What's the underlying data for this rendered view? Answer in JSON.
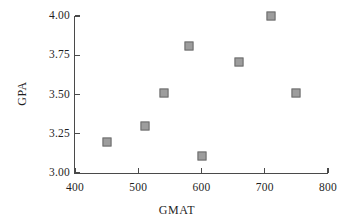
{
  "chart_data": {
    "type": "scatter",
    "title": "",
    "xlabel": "GMAT",
    "ylabel": "GPA",
    "xlim": [
      400,
      800
    ],
    "ylim": [
      3.0,
      4.0
    ],
    "xticks": [
      400,
      500,
      600,
      700,
      800
    ],
    "yticks": [
      3.0,
      3.25,
      3.5,
      3.75,
      4.0
    ],
    "xticklabels": [
      "400",
      "500",
      "600",
      "700",
      "800"
    ],
    "yticklabels": [
      "3.00",
      "3.25",
      "3.50",
      "3.75",
      "4.00"
    ],
    "grid": false,
    "legend": null,
    "marker_style": "square",
    "marker_color": "#9d9d9d",
    "marker_edge_color": "#6d6d6d",
    "axis_color": "#4a4a4a",
    "background_color": "#ffffff",
    "points": [
      {
        "x": 450,
        "y": 3.2,
        "label": "450, 3.20"
      },
      {
        "x": 510,
        "y": 3.3,
        "label": "510, 3.30"
      },
      {
        "x": 540,
        "y": 3.51,
        "label": "540, 3.51"
      },
      {
        "x": 580,
        "y": 3.81,
        "label": "580, 3.81"
      },
      {
        "x": 600,
        "y": 3.11,
        "label": "600, 3.11"
      },
      {
        "x": 660,
        "y": 3.71,
        "label": "660, 3.71"
      },
      {
        "x": 710,
        "y": 4.0,
        "label": "710, 4.00"
      },
      {
        "x": 750,
        "y": 3.51,
        "label": "750, 3.51"
      }
    ]
  },
  "axes": {
    "x_title": "GMAT",
    "y_title": "GPA"
  }
}
